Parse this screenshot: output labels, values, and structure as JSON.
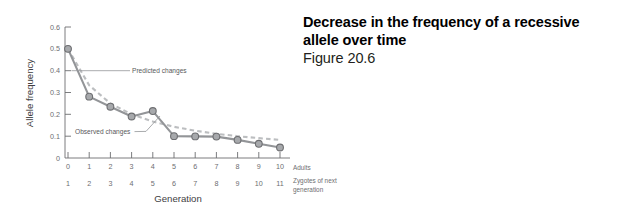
{
  "caption": {
    "title": "Decrease in the frequency of a recessive allele over time",
    "figure_number": "Figure 20.6"
  },
  "chart_data": {
    "type": "line",
    "title": "",
    "xlabel": "Generation",
    "ylabel": "Allele frequency",
    "xlim": [
      0,
      10
    ],
    "ylim": [
      0,
      0.6
    ],
    "grid": false,
    "legend": "none",
    "x": [
      0,
      1,
      2,
      3,
      4,
      5,
      6,
      7,
      8,
      9,
      10
    ],
    "x_tick_labels_adults": [
      "0",
      "1",
      "2",
      "3",
      "4",
      "5",
      "6",
      "7",
      "8",
      "9",
      "10"
    ],
    "x_tick_labels_zygotes": [
      "1",
      "2",
      "3",
      "4",
      "5",
      "6",
      "7",
      "8",
      "9",
      "10",
      "11"
    ],
    "y_tick_labels": [
      "0.6",
      "0.5",
      "0.4",
      "0.3",
      "0.2",
      "0.1",
      "0"
    ],
    "y_tick_values": [
      0.6,
      0.5,
      0.4,
      0.3,
      0.2,
      0.1,
      0
    ],
    "row_label_adults": "Adults",
    "row_label_zygotes": "Zygotes of next generation",
    "series": [
      {
        "name": "Observed changes",
        "style": "solid-with-markers",
        "color": "#939598",
        "values": [
          0.5,
          0.281,
          0.235,
          0.19,
          0.215,
          0.1,
          0.099,
          0.098,
          0.083,
          0.065,
          0.048
        ]
      },
      {
        "name": "Predicted changes",
        "style": "dashed",
        "color": "#bcbec0",
        "values": [
          0.5,
          0.333,
          0.25,
          0.2,
          0.167,
          0.143,
          0.125,
          0.111,
          0.1,
          0.091,
          0.083
        ]
      }
    ],
    "annotations": [
      {
        "text": "Predicted changes",
        "target_x": 0.55,
        "target_y": 0.41
      },
      {
        "text": "Observed changes",
        "target_x": 4.55,
        "target_y": 0.155
      }
    ]
  }
}
